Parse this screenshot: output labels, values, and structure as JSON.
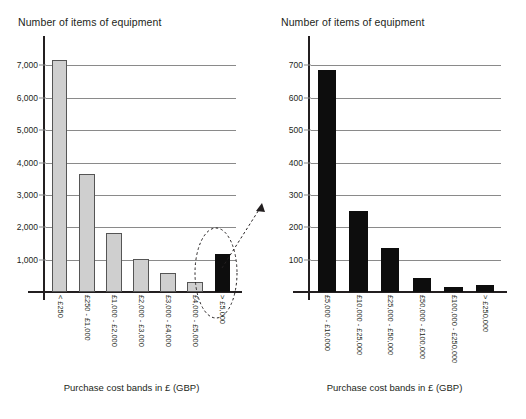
{
  "left": {
    "title": "Number of items of equipment",
    "axis_caption": "Purchase cost bands in £ (GBP)"
  },
  "right": {
    "title": "Number of items of equipment",
    "axis_caption": "Purchase cost bands in £ (GBP)"
  },
  "colors": {
    "grey_bar": "#cfcfcf",
    "black_bar": "#0d0d0d",
    "gridline": "#8a8a8a",
    "axis": "#231f20",
    "text": "#231f20"
  },
  "annotation": {
    "ellipse_label": "highlighted-band->£5,000",
    "arrow_label": "zoom-to-detail-chart"
  },
  "chart_data": [
    {
      "type": "bar",
      "id": "left-overview",
      "title": "Number of items of equipment",
      "xlabel": "Purchase cost bands in £ (GBP)",
      "ylabel": "Number of items of equipment",
      "categories": [
        "< £250",
        "£250 - £1,000",
        "£1,000 - £2,000",
        "£2,000 - £3,000",
        "£3,000 - £4,000",
        "£4,000 - £5,000",
        "> £5,000"
      ],
      "values": [
        7160,
        3660,
        1820,
        1020,
        590,
        300,
        1160
      ],
      "bar_colors": [
        "grey",
        "grey",
        "grey",
        "grey",
        "grey",
        "grey",
        "black"
      ],
      "ylim": [
        0,
        7600
      ],
      "yticks": [
        1000,
        2000,
        3000,
        4000,
        5000,
        6000,
        7000
      ],
      "ytick_labels": [
        "1,000",
        "2,000",
        "3,000",
        "4,000",
        "5,000",
        "6,000",
        "7,000"
      ],
      "grid": true,
      "legend": "none",
      "highlight_category": "> £5,000"
    },
    {
      "type": "bar",
      "id": "right-detail",
      "title": "Number of items of equipment",
      "xlabel": "Purchase cost bands in £ (GBP)",
      "ylabel": "Number of items of equipment",
      "categories": [
        "£5,000 - £10,000",
        "£10,000 - £25,000",
        "£25,000 - £50,000",
        "£50,000 - £100,000",
        "£100,000 - £250,000",
        "> £250,000"
      ],
      "values": [
        685,
        250,
        135,
        44,
        15,
        21
      ],
      "bar_colors": [
        "black",
        "black",
        "black",
        "black",
        "black",
        "black"
      ],
      "ylim": [
        0,
        760
      ],
      "yticks": [
        100,
        200,
        300,
        400,
        500,
        600,
        700
      ],
      "ytick_labels": [
        "100",
        "200",
        "300",
        "400",
        "500",
        "600",
        "700"
      ],
      "grid": true,
      "legend": "none"
    }
  ]
}
